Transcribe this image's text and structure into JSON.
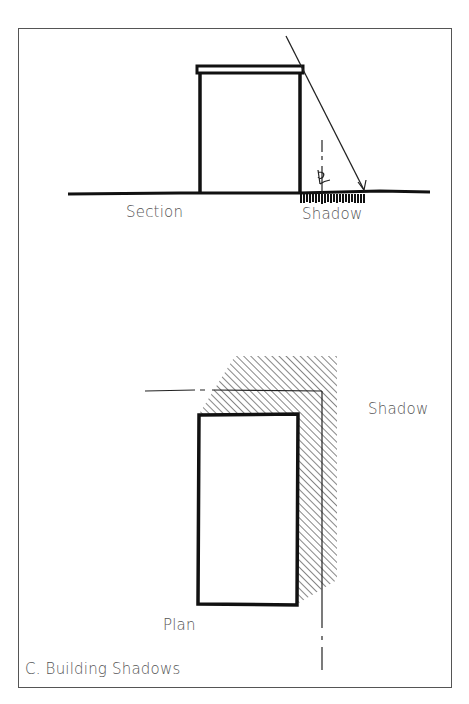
{
  "figure": {
    "caption": "C. Building Shadows",
    "section": {
      "label": "Section",
      "shadow_label": "Shadow",
      "centerline_symbol": "℄"
    },
    "plan": {
      "label": "Plan",
      "shadow_label": "Shadow"
    },
    "colors": {
      "ink": "#111111",
      "text": "#555555",
      "frame": "#555555",
      "background": "#ffffff"
    }
  }
}
